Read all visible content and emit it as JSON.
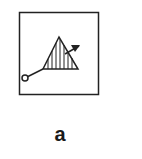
{
  "figure": {
    "label": "a",
    "symbol": "hatched-triangle-with-probe-and-arrow",
    "colors": {
      "stroke": "#222222",
      "background": "#ffffff"
    }
  }
}
